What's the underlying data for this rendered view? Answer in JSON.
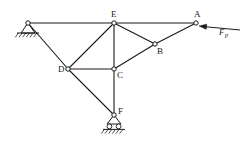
{
  "figure": {
    "type": "truss-free-body-diagram",
    "background_color": "#ffffff",
    "line_color": "#1a1a1a",
    "node_fill_color": "#ffffff"
  },
  "nodes": [
    {
      "id": "G",
      "label": "",
      "x": 28,
      "y": 23,
      "label_dx": 0,
      "label_dy": 0,
      "support": "pin",
      "show_circle": true
    },
    {
      "id": "E",
      "label": "E",
      "x": 114,
      "y": 23,
      "label_dx": -3,
      "label_dy": -6,
      "support": "none",
      "show_circle": true
    },
    {
      "id": "A",
      "label": "A",
      "x": 196,
      "y": 23,
      "label_dx": -2,
      "label_dy": -6,
      "support": "none",
      "show_circle": true
    },
    {
      "id": "D",
      "label": "D",
      "x": 68,
      "y": 69,
      "label_dx": -10,
      "label_dy": 3,
      "support": "none",
      "show_circle": true
    },
    {
      "id": "C",
      "label": "C",
      "x": 114,
      "y": 69,
      "label_dx": 3,
      "label_dy": 9,
      "support": "none",
      "show_circle": true
    },
    {
      "id": "B",
      "label": "B",
      "x": 155,
      "y": 44,
      "label_dx": 2,
      "label_dy": 10,
      "support": "none",
      "show_circle": true
    },
    {
      "id": "F",
      "label": "F",
      "x": 114,
      "y": 115,
      "label_dx": 4,
      "label_dy": -1,
      "support": "roller",
      "show_circle": true
    }
  ],
  "members": [
    {
      "from": "G",
      "to": "E"
    },
    {
      "from": "E",
      "to": "A"
    },
    {
      "from": "G",
      "to": "D"
    },
    {
      "from": "D",
      "to": "E"
    },
    {
      "from": "E",
      "to": "C"
    },
    {
      "from": "E",
      "to": "B"
    },
    {
      "from": "D",
      "to": "C"
    },
    {
      "from": "C",
      "to": "B"
    },
    {
      "from": "B",
      "to": "A"
    },
    {
      "from": "D",
      "to": "F"
    },
    {
      "from": "C",
      "to": "F"
    }
  ],
  "force": {
    "id": "FP",
    "symbol": "F",
    "subscript": "P",
    "applied_at": "A",
    "direction": "left",
    "tail_x": 240,
    "tail_y": 30,
    "head_x": 199,
    "head_y": 26,
    "label_x": 219,
    "label_y": 35
  },
  "supports": {
    "pin": {
      "name": "pin-support",
      "at_node": "G",
      "triangle_half_width": 7,
      "triangle_height": 10,
      "ground_width": 22,
      "hatch_count": 6
    },
    "roller": {
      "name": "roller-support",
      "at_node": "F",
      "triangle_half_width": 7,
      "triangle_height": 9,
      "roller_radius": 2.4,
      "ground_width": 22,
      "hatch_count": 6
    }
  }
}
